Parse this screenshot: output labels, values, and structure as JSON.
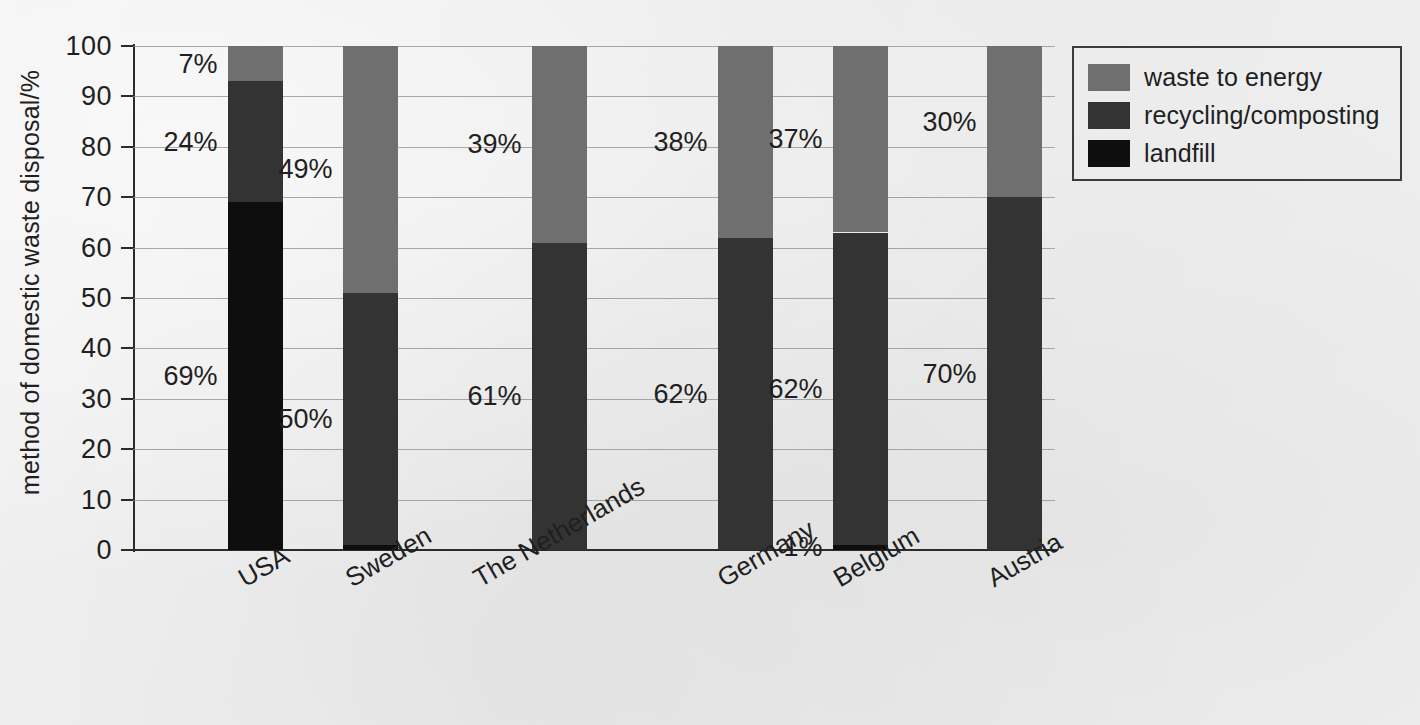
{
  "chart_data": {
    "type": "bar",
    "stacked": true,
    "title": "",
    "xlabel": "",
    "ylabel": "method of domestic waste disposal/%",
    "ylim": [
      0,
      100
    ],
    "yticks": [
      0,
      10,
      20,
      30,
      40,
      50,
      60,
      70,
      80,
      90,
      100
    ],
    "grid": true,
    "legend_position": "right-top",
    "categories": [
      "USA",
      "Sweden",
      "The Netherlands",
      "Germany",
      "Belgium",
      "Austria"
    ],
    "series": [
      {
        "name": "landfill",
        "color": "#0e0e0e",
        "values": [
          69,
          1,
          0,
          0,
          1,
          0
        ],
        "labels": [
          "69%",
          "",
          "",
          "",
          "1%",
          ""
        ]
      },
      {
        "name": "recycling/composting",
        "color": "#333333",
        "values": [
          24,
          50,
          61,
          62,
          62,
          70
        ],
        "labels": [
          "24%",
          "50%",
          "61%",
          "62%",
          "62%",
          "70%"
        ]
      },
      {
        "name": "waste to energy",
        "color": "#6f6f6f",
        "values": [
          7,
          49,
          39,
          38,
          37,
          30
        ],
        "labels": [
          "7%",
          "49%",
          "39%",
          "38%",
          "37%",
          "30%"
        ]
      }
    ]
  },
  "axis": {
    "y_title": "method of domestic waste disposal/%",
    "y_tick_labels": [
      "0",
      "10",
      "20",
      "30",
      "40",
      "50",
      "60",
      "70",
      "80",
      "90",
      "100"
    ]
  },
  "legend": {
    "items": [
      {
        "label": "waste to energy",
        "color": "#6f6f6f"
      },
      {
        "label": "recycling/composting",
        "color": "#333333"
      },
      {
        "label": "landfill",
        "color": "#0e0e0e"
      }
    ]
  },
  "bars": [
    {
      "category": "USA",
      "landfill": {
        "value": 69,
        "label": "69%"
      },
      "recycling": {
        "value": 24,
        "label": "24%"
      },
      "waste_to_energy": {
        "value": 7,
        "label": "7%"
      }
    },
    {
      "category": "Sweden",
      "landfill": {
        "value": 1,
        "label": "1 %"
      },
      "recycling": {
        "value": 50,
        "label": "50%"
      },
      "waste_to_energy": {
        "value": 49,
        "label": "49%"
      }
    },
    {
      "category": "The Netherlands",
      "landfill": {
        "value": 0,
        "label": ""
      },
      "recycling": {
        "value": 61,
        "label": "61%"
      },
      "waste_to_energy": {
        "value": 39,
        "label": "39%"
      }
    },
    {
      "category": "Germany",
      "landfill": {
        "value": 0,
        "label": ""
      },
      "recycling": {
        "value": 62,
        "label": "62%"
      },
      "waste_to_energy": {
        "value": 38,
        "label": "38%"
      }
    },
    {
      "category": "Belgium",
      "landfill": {
        "value": 1,
        "label": "1%"
      },
      "recycling": {
        "value": 62,
        "label": "62%"
      },
      "waste_to_energy": {
        "value": 37,
        "label": "37%"
      }
    },
    {
      "category": "Austria",
      "landfill": {
        "value": 0,
        "label": ""
      },
      "recycling": {
        "value": 70,
        "label": "70%"
      },
      "waste_to_energy": {
        "value": 30,
        "label": "30%"
      }
    }
  ]
}
